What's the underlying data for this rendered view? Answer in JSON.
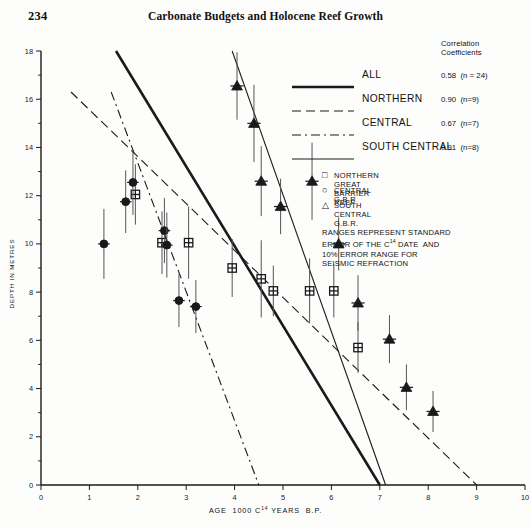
{
  "page": {
    "folio": "234",
    "running_title": "Carbonate Budgets and Holocene Reef Growth"
  },
  "chart_data": {
    "type": "scatter",
    "title": "",
    "xlabel": "AGE 1000 C14 YEARS B.P.",
    "ylabel": "DEPTH IN METRES",
    "xlim": [
      0,
      10
    ],
    "ylim": [
      0,
      18
    ],
    "xticks": [
      0,
      1,
      2,
      3,
      4,
      5,
      6,
      7,
      8,
      9,
      10
    ],
    "xtick_labels": [
      "0",
      "1",
      "2",
      "3",
      "4",
      "5",
      "6",
      "7",
      "8",
      "9",
      "10"
    ],
    "yticks": [
      0,
      2,
      4,
      6,
      8,
      10,
      12,
      14,
      16,
      18
    ],
    "ytick_labels": [
      "0",
      "2",
      "4",
      "6",
      "8",
      "10",
      "12",
      "14",
      "16",
      "18"
    ],
    "y_minor_ticks": [
      1,
      3,
      5,
      7,
      9,
      11,
      13,
      15,
      17
    ],
    "grid": false,
    "y_axis_inverted": false,
    "legend_position": "upper-right",
    "series": [
      {
        "name": "NORTHERN GREAT BARRIER REEF",
        "marker": "square-crossed",
        "points": [
          {
            "x": 1.95,
            "y": 12.05,
            "yerr": 1.25
          },
          {
            "x": 2.5,
            "y": 10.05,
            "yerr": 1.3
          },
          {
            "x": 3.05,
            "y": 10.05,
            "yerr": 1.5
          },
          {
            "x": 3.95,
            "y": 9.0,
            "yerr": 1.2
          },
          {
            "x": 4.55,
            "y": 8.55,
            "yerr": 1.6
          },
          {
            "x": 4.8,
            "y": 8.05,
            "yerr": 1.05
          },
          {
            "x": 5.55,
            "y": 8.05,
            "yerr": 1.35
          },
          {
            "x": 6.05,
            "y": 8.05,
            "yerr": 1.1
          },
          {
            "x": 6.55,
            "y": 5.7,
            "yerr": 1.05
          }
        ]
      },
      {
        "name": "CENTRAL G.B.R.",
        "marker": "circle-filled",
        "points": [
          {
            "x": 1.3,
            "y": 10.0,
            "yerr": 1.45
          },
          {
            "x": 1.75,
            "y": 11.75,
            "yerr": 1.3
          },
          {
            "x": 1.9,
            "y": 12.55,
            "yerr": 1.35
          },
          {
            "x": 2.55,
            "y": 10.55,
            "yerr": 1.35
          },
          {
            "x": 2.6,
            "y": 9.95,
            "yerr": 1.35
          },
          {
            "x": 2.85,
            "y": 7.65,
            "yerr": 1.1
          },
          {
            "x": 3.2,
            "y": 7.4,
            "yerr": 1.1
          }
        ]
      },
      {
        "name": "SOUTH CENTRAL G.B.R.",
        "marker": "triangle-filled",
        "points": [
          {
            "x": 4.05,
            "y": 16.55,
            "yerr": 1.4
          },
          {
            "x": 4.4,
            "y": 15.0,
            "yerr": 1.6
          },
          {
            "x": 4.55,
            "y": 12.6,
            "yerr": 1.45
          },
          {
            "x": 4.95,
            "y": 11.55,
            "yerr": 1.15
          },
          {
            "x": 5.6,
            "y": 12.6,
            "yerr": 1.6
          },
          {
            "x": 6.15,
            "y": 10.0,
            "yerr": 1.1
          },
          {
            "x": 6.55,
            "y": 7.55,
            "yerr": 1.15
          },
          {
            "x": 7.2,
            "y": 6.05,
            "yerr": 1.0
          },
          {
            "x": 7.55,
            "y": 4.05,
            "yerr": 0.95
          },
          {
            "x": 8.1,
            "y": 3.05,
            "yerr": 0.85
          }
        ]
      }
    ],
    "fit_lines": [
      {
        "name": "ALL",
        "style": "solid-thick",
        "x0": 1.55,
        "y0": 18.0,
        "x1": 7.0,
        "y1": 0.0
      },
      {
        "name": "NORTHERN",
        "style": "dashed",
        "x0": 0.62,
        "y0": 16.3,
        "x1": 9.0,
        "y1": 0.0
      },
      {
        "name": "CENTRAL",
        "style": "dash-dot",
        "x0": 1.45,
        "y0": 16.3,
        "x1": 4.5,
        "y1": 0.0
      },
      {
        "name": "SOUTH CENTRAL",
        "style": "solid-thin",
        "x0": 3.95,
        "y0": 18.0,
        "x1": 7.12,
        "y1": 0.0
      }
    ]
  },
  "legend": {
    "correlation_heading_line1": "Correlation",
    "correlation_heading_line2": "Coefficients",
    "entries": [
      {
        "label": "ALL",
        "style": "solid-thick",
        "coefficient": "0.58",
        "n": "(n = 24)"
      },
      {
        "label": "NORTHERN",
        "style": "dashed",
        "coefficient": "0.90",
        "n": "(n=9)"
      },
      {
        "label": "CENTRAL",
        "style": "dash-dot",
        "coefficient": "0.67",
        "n": "(n=7)"
      },
      {
        "label": "SOUTH CENTRAL",
        "style": "solid-thin",
        "coefficient": "0.91",
        "n": "(n=8)"
      }
    ],
    "symbols": [
      {
        "glyph": "square",
        "text": "NORTHERN GREAT BARRIER REEF"
      },
      {
        "glyph": "circle",
        "text": "CENTRAL G.B.R"
      },
      {
        "glyph": "triangle",
        "text": "SOUTH CENTRAL G.B.R."
      }
    ],
    "notes": "RANGES REPRESENT STANDARD\nERROR OF THE C14 DATE  AND\n10% ERROR RANGE FOR\nSEISMIC REFRACTION"
  }
}
